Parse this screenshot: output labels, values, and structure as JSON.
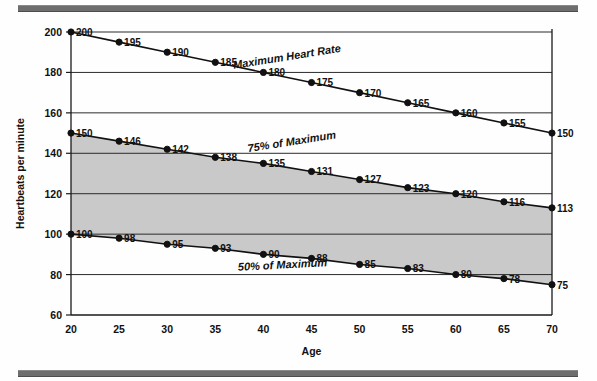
{
  "figure": {
    "top_rule": "horizontal-rule",
    "bottom_rule": "horizontal-rule"
  },
  "chart_data": {
    "type": "line",
    "title": "",
    "xlabel": "Age",
    "ylabel": "Heartbeats per minute",
    "x": [
      20,
      25,
      30,
      35,
      40,
      45,
      50,
      55,
      60,
      65,
      70
    ],
    "xticks": [
      "20",
      "25",
      "30",
      "35",
      "40",
      "45",
      "50",
      "55",
      "60",
      "65",
      "70"
    ],
    "yticks": [
      "60",
      "80",
      "100",
      "120",
      "140",
      "160",
      "180",
      "200"
    ],
    "ytickvals": [
      60,
      80,
      100,
      120,
      140,
      160,
      180,
      200
    ],
    "xlim": [
      20,
      70
    ],
    "ylim": [
      60,
      200
    ],
    "grid": "horizontal",
    "legend": "inline-annotations",
    "shaded_band": {
      "label": "target-heart-rate-zone",
      "color": "#c9c9c9",
      "upper_series": "75% of Maximum",
      "lower_series": "50% of Maximum"
    },
    "series": [
      {
        "name": "Maximum Heart Rate",
        "label": "Maximum Heart Rate",
        "values": [
          200,
          195,
          190,
          185,
          180,
          175,
          170,
          165,
          160,
          155,
          150
        ],
        "annotation_x": 42.5,
        "annotation_y": 186
      },
      {
        "name": "75% of Maximum",
        "label": "75% of Maximum",
        "values": [
          150,
          146,
          142,
          138,
          135,
          131,
          127,
          123,
          120,
          116,
          113
        ],
        "annotation_x": 43,
        "annotation_y": 144
      },
      {
        "name": "50% of Maximum",
        "label": "50% of Maximum",
        "values": [
          100,
          98,
          95,
          93,
          90,
          88,
          85,
          83,
          80,
          78,
          75
        ],
        "annotation_x": 42,
        "annotation_y": 83
      }
    ]
  }
}
